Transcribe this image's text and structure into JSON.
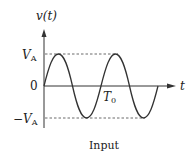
{
  "diagram": {
    "title": "Input",
    "y_axis_label": "v(t)",
    "x_axis_label": "t",
    "y_ticks": [
      {
        "label_main": "V",
        "label_sub": "A",
        "sign": "",
        "value": 1
      },
      {
        "label_main": "0",
        "label_sub": "",
        "sign": "",
        "value": 0
      },
      {
        "label_main": "V",
        "label_sub": "A",
        "sign": "−",
        "value": -1
      }
    ],
    "period_label_main": "T",
    "period_label_sub": "0",
    "waveform": "sine",
    "cycles_shown": 2,
    "colors": {
      "stroke": "#333333",
      "dashed": "#444444"
    }
  }
}
